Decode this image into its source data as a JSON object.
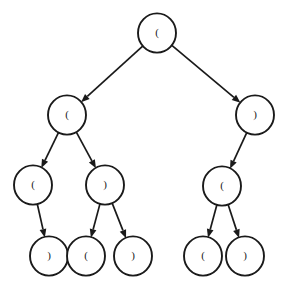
{
  "diagram": {
    "type": "binary-tree",
    "title": "",
    "canvas": {
      "width": 285,
      "height": 290,
      "background": "#ffffff"
    },
    "style": {
      "node_fill": "#ffffff",
      "node_stroke": "#1a1a1a",
      "edge_color": "#1a1a1a",
      "label_color": "#1a1a1a",
      "node_radius": 19
    },
    "nodes": [
      {
        "id": "n0",
        "label": "(",
        "cx": 157,
        "cy": 33,
        "level": 0
      },
      {
        "id": "n1",
        "label": "(",
        "cx": 67,
        "cy": 115,
        "level": 1
      },
      {
        "id": "n2",
        "label": ")",
        "cx": 255,
        "cy": 115,
        "level": 1
      },
      {
        "id": "n3",
        "label": "(",
        "cx": 33,
        "cy": 185,
        "level": 2
      },
      {
        "id": "n4",
        "label": ")",
        "cx": 105,
        "cy": 185,
        "level": 2
      },
      {
        "id": "n5",
        "label": "(",
        "cx": 222,
        "cy": 186,
        "level": 2
      },
      {
        "id": "n6",
        "label": ")",
        "cx": 49,
        "cy": 256,
        "level": 3
      },
      {
        "id": "n7",
        "label": "(",
        "cx": 86,
        "cy": 256,
        "level": 3
      },
      {
        "id": "n8",
        "label": ")",
        "cx": 133,
        "cy": 256,
        "level": 3
      },
      {
        "id": "n9",
        "label": "(",
        "cx": 203,
        "cy": 256,
        "level": 3
      },
      {
        "id": "n10",
        "label": ")",
        "cx": 245,
        "cy": 256,
        "level": 3
      }
    ],
    "edges": [
      {
        "from": "n0",
        "to": "n1",
        "arrow": true
      },
      {
        "from": "n0",
        "to": "n2",
        "arrow": true
      },
      {
        "from": "n1",
        "to": "n3",
        "arrow": true
      },
      {
        "from": "n1",
        "to": "n4",
        "arrow": true
      },
      {
        "from": "n2",
        "to": "n5",
        "arrow": true
      },
      {
        "from": "n3",
        "to": "n6",
        "arrow": true
      },
      {
        "from": "n4",
        "to": "n7",
        "arrow": true
      },
      {
        "from": "n4",
        "to": "n8",
        "arrow": true
      },
      {
        "from": "n5",
        "to": "n9",
        "arrow": true
      },
      {
        "from": "n5",
        "to": "n10",
        "arrow": true
      }
    ]
  }
}
